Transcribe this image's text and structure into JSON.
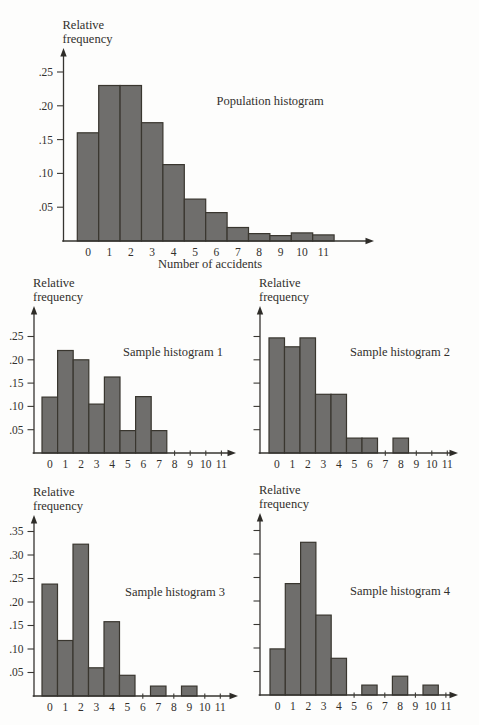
{
  "figure": {
    "background": "#fdfdfc",
    "ink_color": "#32302c",
    "bar_fill": "#6f6e6c",
    "bar_stroke": "#39362f"
  },
  "chart_data": [
    {
      "name": "population-histogram",
      "type": "bar",
      "title": "Population histogram",
      "ylabel": "Relative frequency",
      "xlabel": "Number of accidents",
      "categories": [
        "0",
        "1",
        "2",
        "3",
        "4",
        "5",
        "6",
        "7",
        "8",
        "9",
        "10",
        "11"
      ],
      "values": [
        0.16,
        0.23,
        0.23,
        0.175,
        0.113,
        0.062,
        0.042,
        0.02,
        0.011,
        0.008,
        0.012,
        0.009
      ],
      "ytick_step": 0.05,
      "ytick_labels": [
        ".05",
        ".10",
        ".15",
        ".20",
        ".25"
      ],
      "show_ytick_labels": true,
      "ytick_count": 5,
      "ylim": [
        0,
        0.28
      ],
      "grid": false,
      "legend": "none"
    },
    {
      "name": "sample-histogram-1",
      "type": "bar",
      "title": "Sample histogram 1",
      "ylabel": "Relative frequency",
      "xlabel": "",
      "categories": [
        "0",
        "1",
        "2",
        "3",
        "4",
        "5",
        "6",
        "7",
        "8",
        "9",
        "10",
        "11"
      ],
      "values": [
        0.12,
        0.22,
        0.2,
        0.105,
        0.163,
        0.048,
        0.121,
        0.048,
        0,
        0,
        0,
        0
      ],
      "ytick_step": 0.05,
      "ytick_labels": [
        ".05",
        ".10",
        ".15",
        ".20",
        ".25"
      ],
      "show_ytick_labels": true,
      "ytick_count": 5,
      "ylim": [
        0,
        0.3
      ],
      "grid": false,
      "legend": "none"
    },
    {
      "name": "sample-histogram-2",
      "type": "bar",
      "title": "Sample histogram 2",
      "ylabel": "Relative frequency",
      "xlabel": "",
      "categories": [
        "0",
        "1",
        "2",
        "3",
        "4",
        "5",
        "6",
        "7",
        "8",
        "9",
        "10",
        "11"
      ],
      "values": [
        0.247,
        0.228,
        0.247,
        0.126,
        0.126,
        0.032,
        0.032,
        0,
        0.032,
        0,
        0,
        0
      ],
      "ytick_step": 0.05,
      "ytick_labels": null,
      "show_ytick_labels": false,
      "ytick_count": 5,
      "ylim": [
        0,
        0.3
      ],
      "grid": false,
      "legend": "none"
    },
    {
      "name": "sample-histogram-3",
      "type": "bar",
      "title": "Sample histogram 3",
      "ylabel": "Relative frequency",
      "xlabel": "",
      "categories": [
        "0",
        "1",
        "2",
        "3",
        "4",
        "5",
        "6",
        "7",
        "8",
        "9",
        "10",
        "11"
      ],
      "values": [
        0.238,
        0.118,
        0.323,
        0.06,
        0.158,
        0.044,
        0,
        0.021,
        0,
        0.021,
        0,
        0
      ],
      "ytick_step": 0.05,
      "ytick_labels": [
        ".05",
        ".10",
        ".15",
        ".20",
        ".25",
        ".30",
        ".35"
      ],
      "show_ytick_labels": true,
      "ytick_count": 7,
      "ylim": [
        0,
        0.38
      ],
      "grid": false,
      "legend": "none"
    },
    {
      "name": "sample-histogram-4",
      "type": "bar",
      "title": "Sample histogram 4",
      "ylabel": "Relative frequency",
      "xlabel": "",
      "categories": [
        "0",
        "1",
        "2",
        "3",
        "4",
        "5",
        "6",
        "7",
        "8",
        "9",
        "10",
        "11"
      ],
      "values": [
        0.098,
        0.237,
        0.325,
        0.17,
        0.078,
        0,
        0.021,
        0,
        0.04,
        0,
        0.021,
        0
      ],
      "ytick_step": 0.05,
      "ytick_labels": null,
      "show_ytick_labels": false,
      "ytick_count": 7,
      "ylim": [
        0,
        0.38
      ],
      "grid": false,
      "legend": "none"
    }
  ]
}
